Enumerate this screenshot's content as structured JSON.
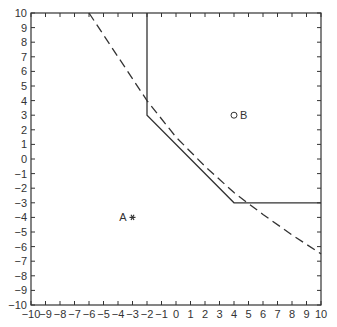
{
  "chart_data": {
    "type": "line",
    "title": "",
    "xlabel": "",
    "ylabel": "",
    "xlim": [
      -10,
      10
    ],
    "ylim": [
      -10,
      10
    ],
    "grid": false,
    "legend": null,
    "x_ticks": [
      -10,
      -9,
      -8,
      -7,
      -6,
      -5,
      -4,
      -3,
      -2,
      -1,
      0,
      1,
      2,
      3,
      4,
      5,
      6,
      7,
      8,
      9,
      10
    ],
    "y_ticks": [
      -10,
      -9,
      -8,
      -7,
      -6,
      -5,
      -4,
      -3,
      -2,
      -1,
      0,
      1,
      2,
      3,
      4,
      5,
      6,
      7,
      8,
      9,
      10
    ],
    "series": [
      {
        "name": "solid boundary",
        "style": "solid",
        "points": [
          [
            -2,
            10
          ],
          [
            -2,
            3
          ],
          [
            4,
            -3
          ],
          [
            10,
            -3
          ]
        ]
      },
      {
        "name": "dashed boundary",
        "style": "dashed",
        "points": [
          [
            -6,
            10
          ],
          [
            -2,
            4
          ],
          [
            0,
            1.5
          ],
          [
            2,
            -0.5
          ],
          [
            4,
            -2.3
          ],
          [
            6,
            -3.8
          ],
          [
            8,
            -5.2
          ],
          [
            10,
            -6.5
          ]
        ]
      }
    ],
    "annotations": [
      {
        "label": "A",
        "x": -3,
        "y": -4,
        "marker": "asterisk",
        "label_side": "left"
      },
      {
        "label": "B",
        "x": 4,
        "y": 3,
        "marker": "open-circle",
        "label_side": "right"
      }
    ]
  },
  "colors": {
    "axis": "#333333",
    "line": "#333333",
    "background": "#ffffff"
  }
}
